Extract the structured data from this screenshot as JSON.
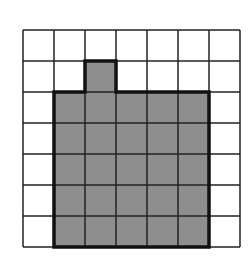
{
  "diagram": {
    "type": "grid-shape",
    "rows": 7,
    "cols": 7,
    "origin_x": 23,
    "origin_y": 30,
    "cell_size": 31,
    "grid_line_color": "#222222",
    "shape_fill": "#8e8e8e",
    "shape_border_color": "#111111",
    "shaded_cells": [
      [
        1,
        2
      ],
      [
        2,
        1
      ],
      [
        2,
        2
      ],
      [
        2,
        3
      ],
      [
        2,
        4
      ],
      [
        2,
        5
      ],
      [
        3,
        1
      ],
      [
        3,
        2
      ],
      [
        3,
        3
      ],
      [
        3,
        4
      ],
      [
        3,
        5
      ],
      [
        4,
        1
      ],
      [
        4,
        2
      ],
      [
        4,
        3
      ],
      [
        4,
        4
      ],
      [
        4,
        5
      ],
      [
        5,
        1
      ],
      [
        5,
        2
      ],
      [
        5,
        3
      ],
      [
        5,
        4
      ],
      [
        5,
        5
      ],
      [
        6,
        1
      ],
      [
        6,
        2
      ],
      [
        6,
        3
      ],
      [
        6,
        4
      ],
      [
        6,
        5
      ]
    ],
    "shape_outline": [
      [
        2,
        1
      ],
      [
        3,
        1
      ],
      [
        3,
        2
      ],
      [
        6,
        2
      ],
      [
        6,
        7
      ],
      [
        1,
        7
      ],
      [
        1,
        2
      ],
      [
        2,
        2
      ]
    ]
  }
}
